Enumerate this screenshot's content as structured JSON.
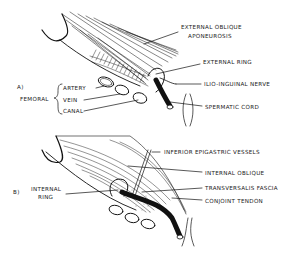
{
  "panel_a": {
    "id": "A)",
    "group_label": "FEMORAL",
    "group_items": [
      "ARTERY",
      "VEIN",
      "CANAL"
    ],
    "labels": {
      "external_oblique_1": "EXTERNAL OBLIQUE",
      "external_oblique_2": "APONEUROSIS",
      "external_ring": "EXTERNAL RING",
      "ilio_inguinal": "ILIO-INGUINAL NERVE",
      "spermatic_cord": "SPERMATIC CORD"
    }
  },
  "panel_b": {
    "id": "B)",
    "internal_ring_1": "INTERNAL",
    "internal_ring_2": "RING",
    "labels": {
      "inferior_epigastric": "INFERIOR EPIGASTRIC VESSELS",
      "internal_oblique": "INTERNAL OBLIQUE",
      "transversalis": "TRANSVERSALIS FASCIA",
      "conjoint": "CONJOINT TENDON"
    }
  }
}
